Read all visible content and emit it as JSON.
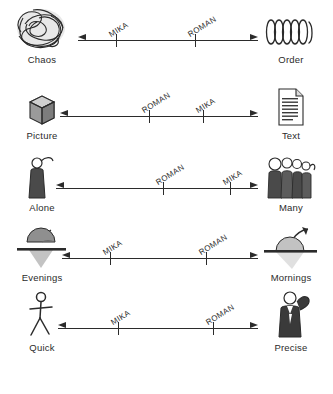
{
  "diagram": {
    "people": [
      "MIKA",
      "ROMAN"
    ],
    "colors": {
      "ink": "#2b2b2b",
      "background": "#ffffff",
      "icon_dark": "#3a3a3a",
      "icon_mid": "#9a9a9a",
      "icon_pale": "#cfcfcf"
    },
    "rows": [
      {
        "left_label": "Chaos",
        "right_label": "Order",
        "left_icon": "scribble-tangle-icon",
        "right_icon": "coil-spring-icon",
        "markers": [
          {
            "name": "MIKA",
            "position_pct": 21
          },
          {
            "name": "ROMAN",
            "position_pct": 65
          }
        ]
      },
      {
        "left_label": "Picture",
        "right_label": "Text",
        "left_icon": "cube-icon",
        "right_icon": "document-page-icon",
        "markers": [
          {
            "name": "ROMAN",
            "position_pct": 45
          },
          {
            "name": "MIKA",
            "position_pct": 72
          }
        ]
      },
      {
        "left_label": "Alone",
        "right_label": "Many",
        "left_icon": "single-person-icon",
        "right_icon": "crowd-of-people-icon",
        "markers": [
          {
            "name": "ROMAN",
            "position_pct": 50
          },
          {
            "name": "MIKA",
            "position_pct": 79
          }
        ]
      },
      {
        "left_label": "Evenings",
        "right_label": "Mornings",
        "left_icon": "setting-sun-icon",
        "right_icon": "rising-sun-icon",
        "markers": [
          {
            "name": "MIKA",
            "position_pct": 24
          },
          {
            "name": "ROMAN",
            "position_pct": 73
          }
        ]
      },
      {
        "left_label": "Quick",
        "right_label": "Precise",
        "left_icon": "running-stick-figure-icon",
        "right_icon": "person-in-suit-icon",
        "markers": [
          {
            "name": "MIKA",
            "position_pct": 30
          },
          {
            "name": "ROMAN",
            "position_pct": 77
          }
        ]
      }
    ]
  }
}
